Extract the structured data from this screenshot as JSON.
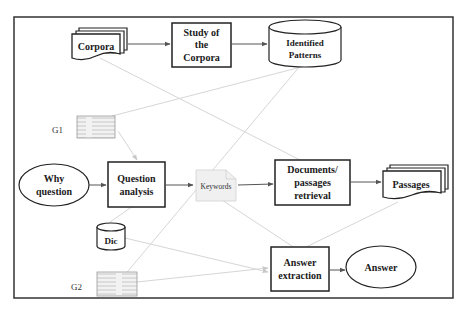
{
  "diagram": {
    "nodes": {
      "corpora": {
        "label": "Corpora",
        "shape": "multi-document"
      },
      "study": {
        "lines": [
          "Study of",
          "the",
          "Corpora"
        ],
        "shape": "rectangle"
      },
      "patterns": {
        "lines": [
          "Identified",
          "Patterns"
        ],
        "shape": "cylinder"
      },
      "g1": {
        "label": "G1",
        "shape": "image-thumbnail"
      },
      "why": {
        "lines": [
          "Why",
          "question"
        ],
        "shape": "ellipse"
      },
      "qa": {
        "lines": [
          "Question",
          "analysis"
        ],
        "shape": "rectangle"
      },
      "keywords": {
        "label": "Keywords",
        "shape": "document-icon"
      },
      "retrieval": {
        "lines": [
          "Documents/",
          "passages",
          "retrieval"
        ],
        "shape": "rectangle"
      },
      "passages": {
        "label": "Passages",
        "shape": "multi-document"
      },
      "dic": {
        "label": "Dic",
        "shape": "cylinder"
      },
      "g2": {
        "label": "G2",
        "shape": "image-thumbnail"
      },
      "extraction": {
        "lines": [
          "Answer",
          "extraction"
        ],
        "shape": "rectangle"
      },
      "answer": {
        "label": "Answer",
        "shape": "ellipse"
      }
    },
    "edges": [
      {
        "from": "Corpora",
        "to": "Study of the Corpora",
        "style": "arrow"
      },
      {
        "from": "Study of the Corpora",
        "to": "Identified Patterns",
        "style": "arrow"
      },
      {
        "from": "Why question",
        "to": "Question analysis",
        "style": "arrow"
      },
      {
        "from": "Question analysis",
        "to": "Keywords",
        "style": "arrow"
      },
      {
        "from": "Keywords",
        "to": "Documents/passages retrieval",
        "style": "arrow"
      },
      {
        "from": "Documents/passages retrieval",
        "to": "Passages",
        "style": "arrow"
      },
      {
        "from": "Answer extraction",
        "to": "Answer",
        "style": "arrow"
      },
      {
        "from": "G1",
        "to": "Question analysis",
        "style": "faint-arrow"
      },
      {
        "from": "Corpora",
        "to": "Documents/passages retrieval",
        "style": "faint"
      },
      {
        "from": "Identified Patterns",
        "to": "G1",
        "style": "faint"
      },
      {
        "from": "Identified Patterns",
        "to": "G2",
        "style": "faint"
      },
      {
        "from": "Dic",
        "to": "Question analysis",
        "style": "faint"
      },
      {
        "from": "Dic",
        "to": "Answer extraction",
        "style": "faint-arrow"
      },
      {
        "from": "G2",
        "to": "Answer extraction",
        "style": "faint-arrow"
      },
      {
        "from": "Keywords",
        "to": "Answer extraction",
        "style": "faint"
      },
      {
        "from": "Passages",
        "to": "Answer extraction",
        "style": "faint"
      }
    ]
  }
}
